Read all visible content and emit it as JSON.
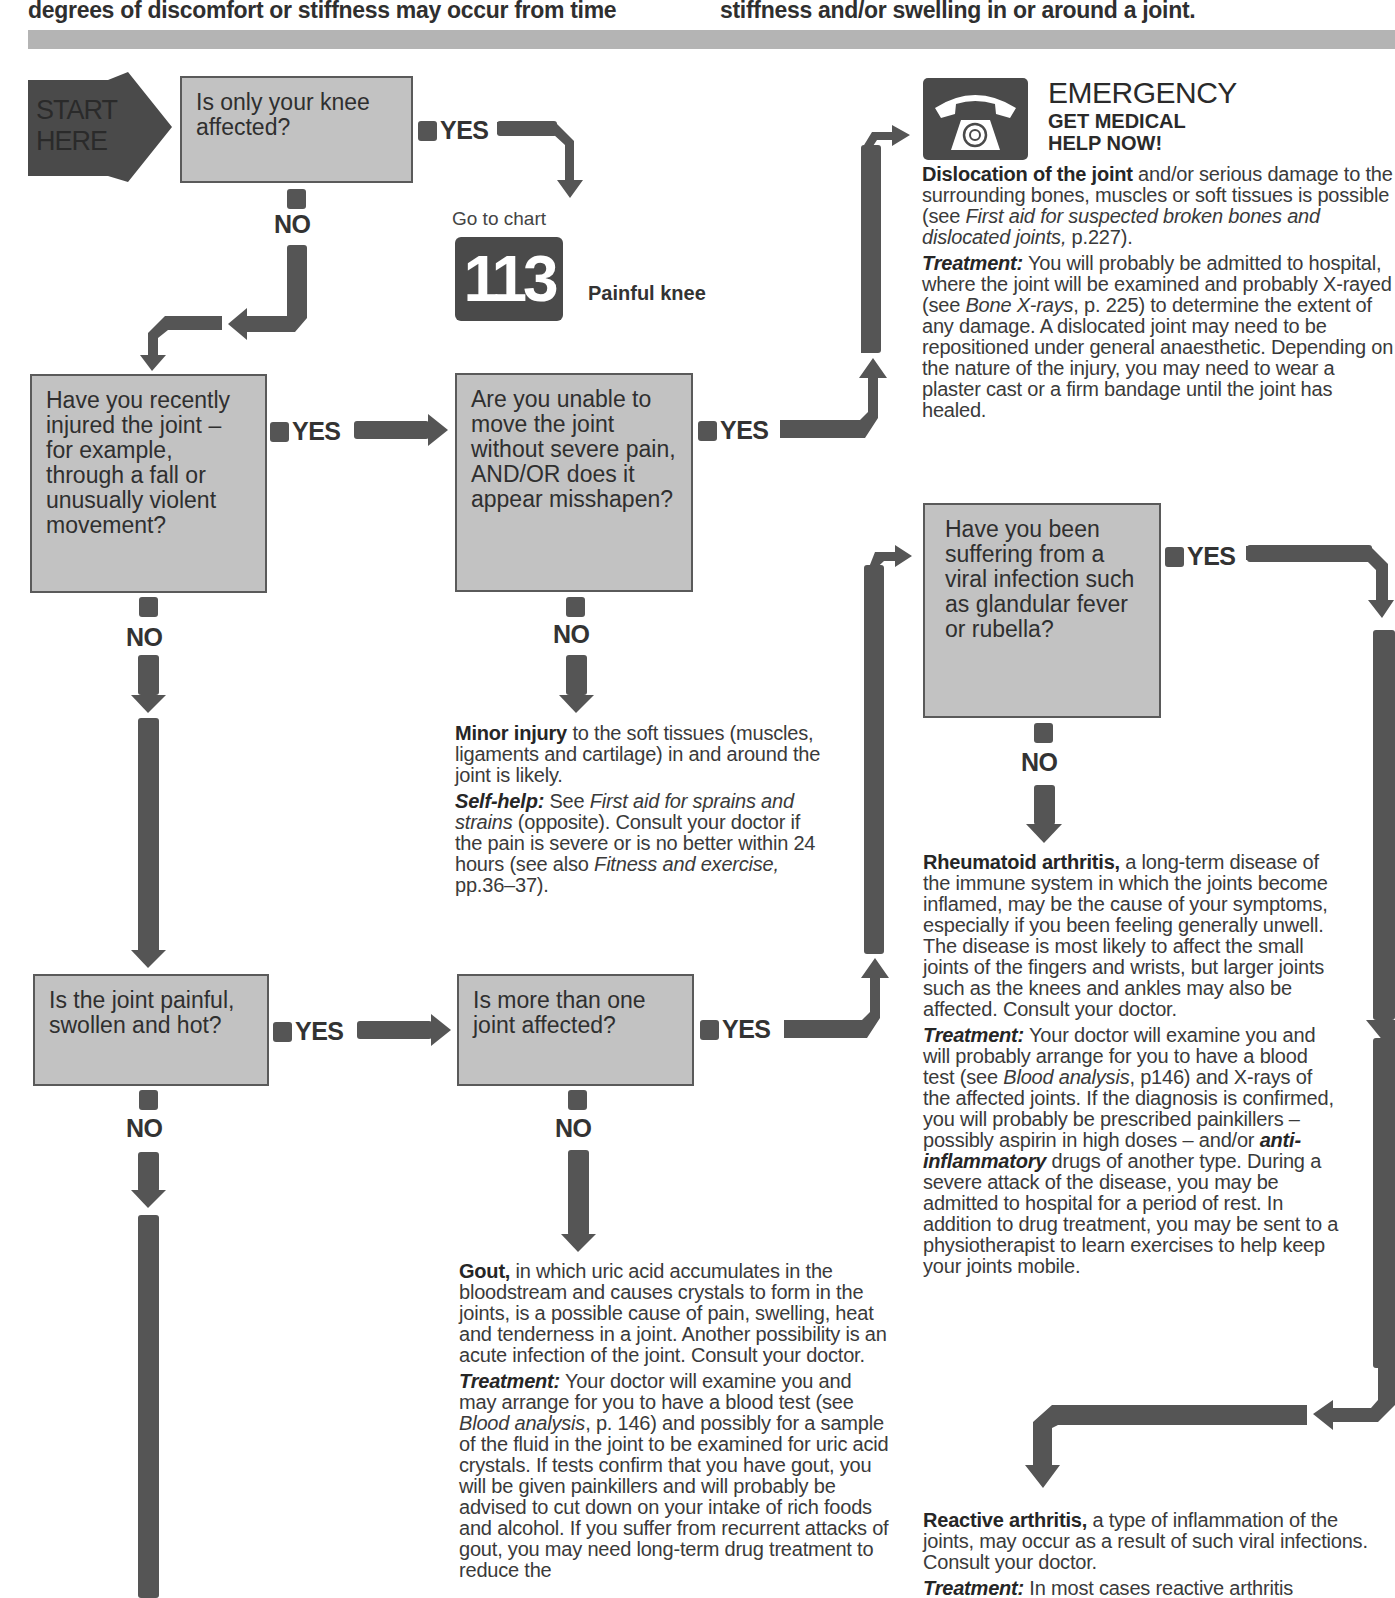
{
  "header": {
    "left_text": "degrees of discomfort or stiffness may occur from time",
    "right_text": "stiffness and/or swelling in or around a joint."
  },
  "start": {
    "line1": "START",
    "line2": "HERE"
  },
  "questions": {
    "q1": "Is only your knee affected?",
    "q2": "Have you recently injured the joint – for example, through a fall or unusually violent movement?",
    "q3": "Are you unable to move the joint without severe pain, AND/OR does it appear misshapen?",
    "q4": "Is the joint painful, swollen and hot?",
    "q5": "Is more than one joint affected?",
    "q6": "Have you been suffering from a viral infection such as glandular fever or rubella?"
  },
  "labels": {
    "yes": "YES",
    "no": "NO"
  },
  "goto_chart": {
    "prefix": "Go to chart",
    "number": "113",
    "title": "Painful knee"
  },
  "emergency": {
    "icon": "telephone-icon",
    "title": "EMERGENCY",
    "subtitle1": "GET MEDICAL",
    "subtitle2": "HELP NOW!",
    "diag_bold": "Dislocation of the joint",
    "diag_text1": " and/or serious damage to the surrounding bones, muscles or soft tissues is possible (see ",
    "diag_italic": "First aid for suspected broken bones and dislocated joints,",
    "diag_text2": " p.227).",
    "treat_label": "Treatment:",
    "treat_text1": " You will probably be admitted to hospital, where the joint will be examined and probably X-rayed (see ",
    "treat_italic": "Bone X-rays",
    "treat_text2": ", p. 225) to determine the extent of any damage. A dislocated joint may need to be repositioned under general anaesthetic. Depending on the nature of the injury, you may need to wear a plaster cast or a firm bandage until the joint has healed."
  },
  "minor_injury": {
    "bold": "Minor injury",
    "text": " to the soft tissues (muscles, ligaments and cartilage) in and around the joint is likely.",
    "self_help_label": "Self-help:",
    "sh_text1": " See ",
    "sh_italic1": "First aid for sprains and strains",
    "sh_text2": " (opposite). Consult your doctor if the pain is severe or is no better within 24 hours (see also ",
    "sh_italic2": "Fitness and exercise,",
    "sh_text3": " pp.36–37)."
  },
  "rheumatoid": {
    "bold": "Rheumatoid arthritis,",
    "text": " a long-term disease of the immune system in which the joints become inflamed, may be the cause of your symptoms, especially if you been feeling generally unwell. The disease is most likely to affect the small joints of the fingers and wrists, but larger joints such as the knees and ankles may also be affected. Consult your doctor.",
    "treat_label": "Treatment:",
    "treat_text1": " Your doctor will examine you and will probably arrange for you to have a blood test (see ",
    "treat_italic1": "Blood analysis",
    "treat_text2": ", p146) and X-rays of the affected joints. If the diagnosis is confirmed, you will probably be prescribed painkillers – possibly aspirin in high doses – and/or ",
    "treat_italic2": "anti-inflammatory",
    "treat_text3": " drugs of another type. During a severe attack of the disease, you may be admitted to hospital for a period of rest. In addition to drug treatment, you may be sent to a physiotherapist to learn exercises to help keep your joints mobile."
  },
  "gout": {
    "bold": "Gout,",
    "text": " in which uric acid accumulates in the bloodstream and causes crystals to form in the joints, is a possible cause of pain, swelling, heat and tenderness in a joint. Another possibility is an acute infection of the joint. Consult your doctor.",
    "treat_label": "Treatment:",
    "treat_text1": " Your doctor will examine you and may arrange for you to have a blood test (see ",
    "treat_italic": "Blood analysis",
    "treat_text2": ", p. 146) and possibly for a sample of the fluid in the joint to be examined for uric acid crystals. If tests confirm that you have gout, you will be given painkillers and will probably be advised to cut down on your intake of rich foods and alcohol. If you suffer from recurrent attacks of gout, you may need long-term drug treatment to reduce the"
  },
  "reactive": {
    "bold": "Reactive arthritis,",
    "text": " a type of inflammation of the joints, may occur as a result of such viral infections. Consult your doctor.",
    "treat_label": "Treatment:",
    "treat_text": " In most cases reactive arthritis"
  },
  "colors": {
    "box_fill": "#c2c2c2",
    "arrow": "#555555",
    "band": "#b4b4b4",
    "start": "#4a4a4a"
  }
}
